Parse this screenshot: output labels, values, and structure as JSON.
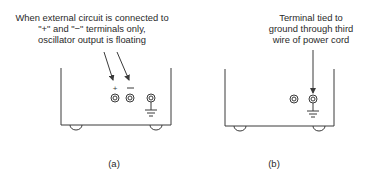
{
  "panels": [
    {
      "id": "a",
      "label": "(a)",
      "annotation": [
        "When external circuit is connected to",
        "\"+\" and \"−\" terminals only,",
        "oscillator output is floating"
      ],
      "terminals": [
        {
          "symbol": "+",
          "type": "output"
        },
        {
          "symbol": "−",
          "type": "output"
        },
        {
          "symbol": "ground",
          "type": "ground"
        }
      ]
    },
    {
      "id": "b",
      "label": "(b)",
      "annotation": [
        "Terminal tied to",
        "ground through third",
        "wire of power cord"
      ],
      "terminals": [
        {
          "symbol": "",
          "type": "output"
        },
        {
          "symbol": "ground",
          "type": "ground"
        }
      ]
    }
  ],
  "colors": {
    "line": "#3a3a3a",
    "background": "#ffffff"
  }
}
